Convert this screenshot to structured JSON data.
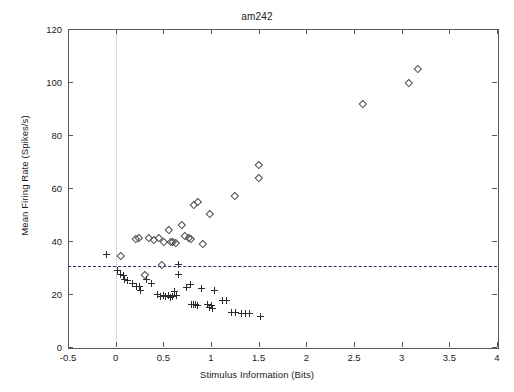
{
  "chart_data": {
    "type": "scatter",
    "title": "am242",
    "xlabel": "Stimulus Information (Bits)",
    "ylabel": "Mean Firing Rate (Spikes/s)",
    "xlim": [
      -0.5,
      4
    ],
    "ylim": [
      0,
      120
    ],
    "xticks": [
      -0.5,
      0,
      0.5,
      1,
      1.5,
      2,
      2.5,
      3,
      3.5,
      4
    ],
    "xticklabels": [
      "-0.5",
      "0",
      "0.5",
      "1",
      "1.5",
      "2",
      "2.5",
      "3",
      "3.5",
      "4"
    ],
    "yticks": [
      0,
      20,
      40,
      60,
      80,
      100,
      120
    ],
    "yticklabels": [
      "0",
      "20",
      "40",
      "60",
      "80",
      "100",
      "120"
    ],
    "grid": false,
    "legend": "none",
    "annotations": [
      {
        "name": "baseline-rate-line",
        "type": "hline",
        "y": 30.6,
        "style": "dashed",
        "color": "#2b2b6b"
      },
      {
        "name": "zero-bits-line",
        "type": "vline",
        "x": 0.0,
        "style": "dotted",
        "color": "#b9b9b9"
      }
    ],
    "series": [
      {
        "name": "Driven rate (diamonds)",
        "marker": "diamond",
        "color": "#4a4a4a",
        "points": [
          [
            0.05,
            34.5
          ],
          [
            0.21,
            41.0
          ],
          [
            0.24,
            41.5
          ],
          [
            0.3,
            27.5
          ],
          [
            0.34,
            41.5
          ],
          [
            0.4,
            40.5
          ],
          [
            0.45,
            41.5
          ],
          [
            0.48,
            31.0
          ],
          [
            0.5,
            40.0
          ],
          [
            0.55,
            44.5
          ],
          [
            0.58,
            40.0
          ],
          [
            0.6,
            40.0
          ],
          [
            0.63,
            39.5
          ],
          [
            0.69,
            46.4
          ],
          [
            0.72,
            42.0
          ],
          [
            0.76,
            41.5
          ],
          [
            0.78,
            41.0
          ],
          [
            0.82,
            53.6
          ],
          [
            0.86,
            55.0
          ],
          [
            0.91,
            39.2
          ],
          [
            0.98,
            50.2
          ],
          [
            1.25,
            57.0
          ],
          [
            1.5,
            63.8
          ],
          [
            1.5,
            68.7
          ],
          [
            2.59,
            92.0
          ],
          [
            3.07,
            100.0
          ],
          [
            3.17,
            105.0
          ]
        ]
      },
      {
        "name": "Spontaneous rate (plus)",
        "marker": "plus",
        "color": "#2d2d2d",
        "points": [
          [
            -0.1,
            35.0
          ],
          [
            0.02,
            29.0
          ],
          [
            0.05,
            27.5
          ],
          [
            0.08,
            27.0
          ],
          [
            0.09,
            25.5
          ],
          [
            0.12,
            25.0
          ],
          [
            0.18,
            24.0
          ],
          [
            0.22,
            23.0
          ],
          [
            0.25,
            23.0
          ],
          [
            0.26,
            21.5
          ],
          [
            0.32,
            25.5
          ],
          [
            0.38,
            24.0
          ],
          [
            0.44,
            20.0
          ],
          [
            0.47,
            19.0
          ],
          [
            0.5,
            19.5
          ],
          [
            0.52,
            19.0
          ],
          [
            0.55,
            19.5
          ],
          [
            0.57,
            18.5
          ],
          [
            0.6,
            19.0
          ],
          [
            0.62,
            21.0
          ],
          [
            0.64,
            19.5
          ],
          [
            0.66,
            31.0
          ],
          [
            0.66,
            27.5
          ],
          [
            0.74,
            22.5
          ],
          [
            0.78,
            23.5
          ],
          [
            0.8,
            16.0
          ],
          [
            0.82,
            16.0
          ],
          [
            0.84,
            16.0
          ],
          [
            0.86,
            15.5
          ],
          [
            0.9,
            22.0
          ],
          [
            0.96,
            16.0
          ],
          [
            0.98,
            15.0
          ],
          [
            1.0,
            15.5
          ],
          [
            1.02,
            14.5
          ],
          [
            1.04,
            21.5
          ],
          [
            1.12,
            17.5
          ],
          [
            1.16,
            17.5
          ],
          [
            1.22,
            13.0
          ],
          [
            1.26,
            13.0
          ],
          [
            1.32,
            12.5
          ],
          [
            1.36,
            12.5
          ],
          [
            1.4,
            12.5
          ],
          [
            1.52,
            11.5
          ]
        ]
      }
    ]
  }
}
